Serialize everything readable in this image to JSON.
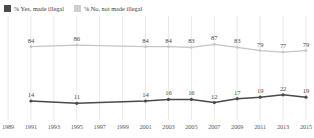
{
  "legend": {
    "items": [
      {
        "label": "% Yes, made illegal",
        "color": "#4a4a4a",
        "key": "yes"
      },
      {
        "label": "% No, not made illegal",
        "color": "#c9c9c9",
        "key": "no"
      }
    ]
  },
  "colors": {
    "series_yes": "#4a4a4a",
    "series_no": "#c5c5c5",
    "gridline": "#e2e2e2",
    "axis_text": "#5a5a5a",
    "label_text": "#4a4a4a",
    "background": "#ffffff"
  },
  "axis": {
    "ticks": [
      "1989",
      "1991",
      "1993",
      "1995",
      "1997",
      "1999",
      "2001",
      "2003",
      "2005",
      "2007",
      "2009",
      "2011",
      "2013",
      "2015"
    ]
  },
  "chart_data": {
    "type": "line",
    "title": "",
    "subtitle": "",
    "xlabel": "",
    "ylabel": "",
    "grid": true,
    "legend_position": "top-left",
    "xlim": [
      1989,
      2015
    ],
    "ylim": [
      0,
      100
    ],
    "x": [
      1991,
      1995,
      2001,
      2003,
      2005,
      2007,
      2009,
      2011,
      2013,
      2015
    ],
    "xticklabels": [
      "1989",
      "1991",
      "1993",
      "1995",
      "1997",
      "1999",
      "2001",
      "2003",
      "2005",
      "2007",
      "2009",
      "2011",
      "2013",
      "2015"
    ],
    "series": [
      {
        "name": "% No, not made illegal",
        "color": "#c5c5c5",
        "values": [
          84,
          86,
          84,
          84,
          83,
          87,
          83,
          79,
          77,
          79
        ],
        "labels": [
          "84",
          "86",
          "84",
          "84",
          "83",
          "87",
          "83",
          "79",
          "77",
          "79"
        ]
      },
      {
        "name": "% Yes, made illegal",
        "color": "#4a4a4a",
        "values": [
          14,
          11,
          14,
          16,
          16,
          12,
          17,
          19,
          22,
          19
        ],
        "labels": [
          "14",
          "11",
          "14",
          "16",
          "16",
          "12",
          "17",
          "19",
          "22",
          "19"
        ]
      }
    ]
  }
}
